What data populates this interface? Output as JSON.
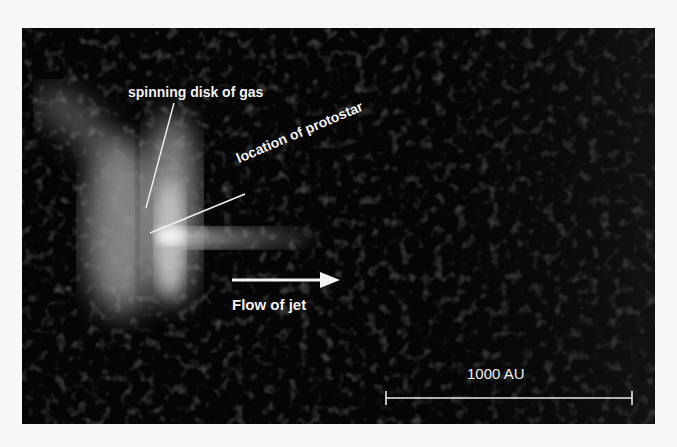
{
  "figure": {
    "labels": {
      "disk": "spinning disk of gas",
      "protostar": "location of protostar",
      "jet": "Flow of jet"
    },
    "scale_bar": {
      "label": "1000 AU"
    },
    "colors": {
      "background": "#050505",
      "page": "#f7f7f7",
      "annotation": "#f2f2f2"
    }
  }
}
